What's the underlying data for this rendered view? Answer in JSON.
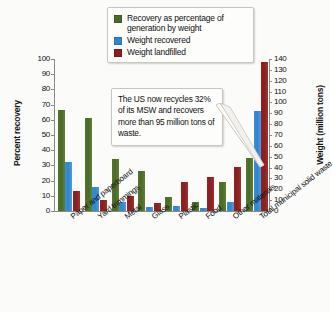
{
  "legend": {
    "items": [
      {
        "label": "Recovery as percentage of generation by weight",
        "color": "#4a6b27",
        "name": "recovery-percentage"
      },
      {
        "label": "Weight recovered",
        "color": "#2e86ce",
        "name": "weight-recovered"
      },
      {
        "label": "Weight landfilled",
        "color": "#8a1f1f",
        "name": "weight-landfilled"
      }
    ]
  },
  "callout": {
    "text": "The US now recycles 32% of its MSW and recovers more than 95 million tons of waste."
  },
  "chart_data": {
    "type": "bar",
    "title": "",
    "subtitle": "",
    "xlabel": "",
    "ylabel": "Percent recovery",
    "ylabel_right": "Weight (million tons)",
    "ylim": [
      0,
      100
    ],
    "ylim_right": [
      0,
      140
    ],
    "grid": false,
    "legend_position": "top-center",
    "categories": [
      "Paper and paperboard",
      "Yard trimmings",
      "Metal",
      "Glass",
      "Plastic",
      "Food",
      "Other materials",
      "Total municipal solid waste"
    ],
    "yticks_left": [
      0,
      10,
      20,
      30,
      40,
      50,
      60,
      70,
      80,
      90,
      100
    ],
    "yticks_right": [
      0,
      10,
      20,
      30,
      40,
      50,
      60,
      70,
      80,
      90,
      100,
      110,
      120,
      130,
      140
    ],
    "series": [
      {
        "name": "Recovery as percentage of generation by weight",
        "axis": "left",
        "color": "#4a6b27",
        "values": [
          66.5,
          61.5,
          34.5,
          26.5,
          9.5,
          6.0,
          19.0,
          35.0
        ]
      },
      {
        "name": "Weight recovered",
        "axis": "right",
        "color": "#2e86ce",
        "values": [
          45.0,
          22.0,
          8.5,
          3.5,
          4.5,
          3.0,
          8.5,
          92.0
        ]
      },
      {
        "name": "Weight landfilled",
        "axis": "right",
        "color": "#8a1f1f",
        "values": [
          18.5,
          10.5,
          13.5,
          7.5,
          26.5,
          31.0,
          40.5,
          137.0
        ]
      }
    ]
  }
}
